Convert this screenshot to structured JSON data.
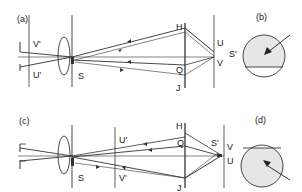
{
  "figure": {
    "panels": [
      {
        "id": "a",
        "label": "(a)",
        "point_labels": {
          "V_prime": "V'",
          "U_prime": "U'",
          "S": "S",
          "H": "H",
          "J": "J",
          "Q": "Q",
          "U": "U",
          "V": "V",
          "S_prime": "S'"
        }
      },
      {
        "id": "b",
        "label": "(b)",
        "description": "circular field of view, shaded upper region, horizontal chord below centre, arrow from upper right"
      },
      {
        "id": "c",
        "label": "(c)",
        "point_labels": {
          "U_prime": "U'",
          "V_prime": "V'",
          "S": "S",
          "H": "H",
          "Q": "Q",
          "J": "J",
          "S_prime": "S'",
          "V": "V",
          "U": "U"
        }
      },
      {
        "id": "d",
        "label": "(d)",
        "description": "circular field of view, shaded lower region, horizontal chord above centre, arrow from lower right"
      }
    ],
    "colors": {
      "ink": "#333333",
      "shade": "#e6e6e6"
    }
  }
}
